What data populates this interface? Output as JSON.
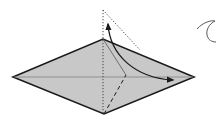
{
  "diagram": {
    "type": "origami-fold-step",
    "colors": {
      "paper_fill": "#c8c8c8",
      "outline": "#1a1a1a",
      "crease": "#777777",
      "dotted": "#333333",
      "background": "#ffffff"
    },
    "shapes": {
      "diamond": {
        "left": [
          13,
          77
        ],
        "top": [
          103,
          39
        ],
        "right": [
          194,
          77
        ],
        "bottom": [
          104,
          114
        ]
      },
      "center_crease": {
        "from": [
          13,
          77
        ],
        "to": [
          194,
          77
        ]
      },
      "vertical_dotted": {
        "from": [
          103,
          10
        ],
        "to": [
          103,
          114
        ]
      },
      "flap_dotted_edge": {
        "from": [
          103,
          10
        ],
        "to": [
          140,
          50
        ]
      },
      "inner_thin_line": {
        "from": [
          103,
          39
        ],
        "to": [
          126,
          75
        ]
      },
      "valley_dashed": {
        "from": [
          104,
          114
        ],
        "to": [
          126,
          75
        ]
      },
      "fold_arrow": {
        "start": [
          108,
          25
        ],
        "end": [
          173,
          80
        ],
        "style": "double-head-curved"
      },
      "turn_over_symbol": {
        "position": [
          197,
          20
        ],
        "meaning": "turn over"
      }
    }
  }
}
